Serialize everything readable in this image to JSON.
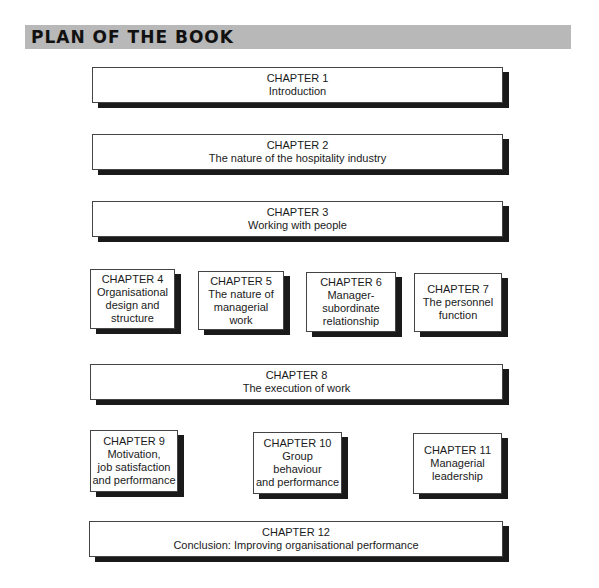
{
  "header": {
    "title": "PLAN OF THE BOOK"
  },
  "chapters": [
    {
      "heading": "CHAPTER 1",
      "title": "Introduction"
    },
    {
      "heading": "CHAPTER 2",
      "title": "The nature of the hospitality industry"
    },
    {
      "heading": "CHAPTER 3",
      "title": "Working with people"
    },
    {
      "heading": "CHAPTER 4",
      "lines": [
        "Organisational",
        "design and",
        "structure"
      ]
    },
    {
      "heading": "CHAPTER 5",
      "lines": [
        "The nature of",
        "managerial",
        "work"
      ]
    },
    {
      "heading": "CHAPTER 6",
      "lines": [
        "Manager-",
        "subordinate",
        "relationship"
      ]
    },
    {
      "heading": "CHAPTER 7",
      "lines": [
        "The personnel",
        "function"
      ]
    },
    {
      "heading": "CHAPTER 8",
      "title": "The execution of work"
    },
    {
      "heading": "CHAPTER 9",
      "lines": [
        "Motivation,",
        "job satisfaction",
        "and performance"
      ]
    },
    {
      "heading": "CHAPTER 10",
      "lines": [
        "Group",
        "behaviour",
        "and performance"
      ]
    },
    {
      "heading": "CHAPTER 11",
      "lines": [
        "Managerial",
        "leadership"
      ]
    },
    {
      "heading": "CHAPTER 12",
      "title": "Conclusion: Improving organisational performance"
    }
  ]
}
